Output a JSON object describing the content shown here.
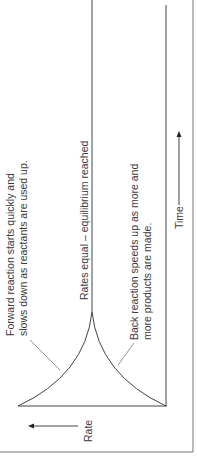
{
  "diagram": {
    "orientation": "rotated 90 degrees clockwise",
    "axes": {
      "y_axis_label": "Rate",
      "x_axis_label": "Time"
    },
    "annotations": {
      "equilibrium": "Rates equal – equilibrium reached",
      "forward_line1": "Forward reaction starts quickly and",
      "forward_line2": "slows down as reactants are used up.",
      "back_line1": "Back reaction speeds up as more and",
      "back_line2": "more products are made."
    },
    "curves": [
      {
        "name": "forward-reaction",
        "description": "starts high, decreases to equilibrium rate"
      },
      {
        "name": "back-reaction",
        "description": "starts at zero, increases to equilibrium rate"
      },
      {
        "name": "equilibrium-line",
        "description": "constant equal rate after curves meet"
      }
    ],
    "colors": {
      "line": "#555555",
      "text": "#3a3a3a",
      "frame": "#777777"
    }
  }
}
